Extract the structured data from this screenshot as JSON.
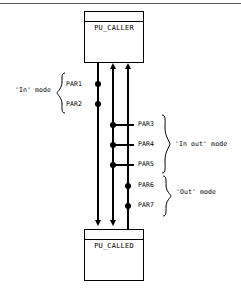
{
  "diagram": {
    "title_caller": "PU_CALLER",
    "title_called": "PU_CALLED",
    "boxes": [
      {
        "id": "caller",
        "label": "PU_CALLER"
      },
      {
        "id": "called",
        "label": "PU_CALLED"
      }
    ],
    "parameters": [
      {
        "name": "PAR1",
        "mode": "In"
      },
      {
        "name": "PAR2",
        "mode": "In"
      },
      {
        "name": "PAR3",
        "mode": "In out"
      },
      {
        "name": "PAR4",
        "mode": "In out"
      },
      {
        "name": "PAR5",
        "mode": "In out"
      },
      {
        "name": "PAR6",
        "mode": "Out"
      },
      {
        "name": "PAR7",
        "mode": "Out"
      }
    ],
    "modes": [
      {
        "id": "in",
        "label": "'In' mode"
      },
      {
        "id": "inout",
        "label": "'In out' mode"
      },
      {
        "id": "out",
        "label": "'Out' mode"
      }
    ],
    "colors": {
      "stroke": "#000000",
      "background": "#ffffff",
      "rule": "#5a5a5a"
    }
  }
}
